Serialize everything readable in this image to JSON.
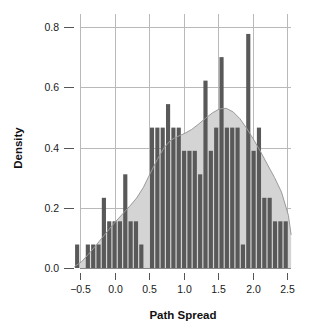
{
  "chart_data": {
    "type": "bar",
    "title": "",
    "subtitle": "",
    "xlabel": "Path Spread",
    "ylabel": "Density",
    "xlim": [
      -0.62,
      2.62
    ],
    "ylim": [
      0.0,
      0.84
    ],
    "xticks": [
      -0.5,
      0.0,
      0.5,
      1.0,
      1.5,
      2.0,
      2.5
    ],
    "xticklabels": [
      "−0.5",
      "0.0",
      "0.5",
      "1.0",
      "1.5",
      "2.0",
      "2.5"
    ],
    "yticks": [
      0.0,
      0.2,
      0.4,
      0.6,
      0.8
    ],
    "yticklabels": [
      "0.0",
      "0.2",
      "0.4",
      "0.6",
      "0.8"
    ],
    "grid": "both",
    "legend": "none",
    "bin_width": 0.0775,
    "bin_left_edges": [
      -0.58,
      -0.5025,
      -0.425,
      -0.3475,
      -0.27,
      -0.1925,
      -0.115,
      -0.0375,
      0.04,
      0.1175,
      0.195,
      0.2725,
      0.35,
      0.4275,
      0.505,
      0.5825,
      0.66,
      0.7375,
      0.815,
      0.8925,
      0.97,
      1.0475,
      1.125,
      1.2025,
      1.28,
      1.3575,
      1.435,
      1.5125,
      1.59,
      1.6675,
      1.745,
      1.8225,
      1.9,
      1.9775,
      2.055,
      2.1325,
      2.21,
      2.2875,
      2.365,
      2.4425
    ],
    "series": [
      {
        "name": "Histogram density",
        "type": "bar",
        "color": "#595959",
        "values": [
          0.078,
          0.0,
          0.078,
          0.078,
          0.078,
          0.233,
          0.155,
          0.155,
          0.155,
          0.311,
          0.155,
          0.155,
          0.078,
          0.0,
          0.466,
          0.466,
          0.466,
          0.544,
          0.466,
          0.466,
          0.389,
          0.389,
          0.389,
          0.311,
          0.622,
          0.389,
          0.466,
          0.7,
          0.466,
          0.466,
          0.466,
          0.078,
          0.777,
          0.389,
          0.466,
          0.233,
          0.233,
          0.155,
          0.155,
          0.155
        ]
      },
      {
        "name": "Kernel density estimate",
        "type": "area",
        "color": "#d4d4d4",
        "x": [
          -0.58,
          -0.48,
          -0.38,
          -0.28,
          -0.18,
          -0.08,
          0.02,
          0.12,
          0.22,
          0.32,
          0.42,
          0.52,
          0.62,
          0.72,
          0.82,
          0.92,
          1.02,
          1.12,
          1.22,
          1.32,
          1.42,
          1.52,
          1.62,
          1.72,
          1.82,
          1.92,
          2.02,
          2.12,
          2.22,
          2.32,
          2.42,
          2.52,
          2.56
        ],
        "values": [
          0.005,
          0.02,
          0.045,
          0.072,
          0.1,
          0.128,
          0.155,
          0.18,
          0.205,
          0.232,
          0.268,
          0.315,
          0.36,
          0.4,
          0.425,
          0.437,
          0.447,
          0.46,
          0.478,
          0.497,
          0.515,
          0.528,
          0.53,
          0.518,
          0.495,
          0.462,
          0.425,
          0.385,
          0.342,
          0.3,
          0.252,
          0.175,
          0.11
        ]
      }
    ]
  },
  "axes": {
    "y_label": "Density",
    "x_label": "Path Spread"
  }
}
